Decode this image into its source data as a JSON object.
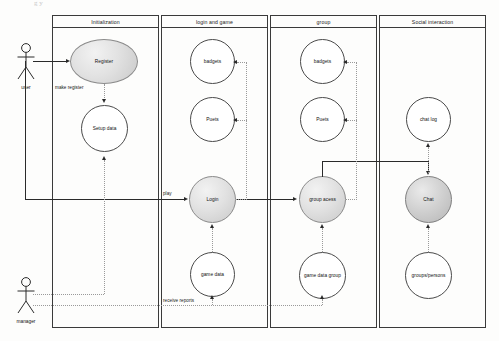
{
  "diagram": {
    "kind": "uml-use-case-diagram",
    "top_partial_caption": "g  y",
    "background": "#fdfdfc",
    "line_color": "#2a2a2a",
    "dotted_color": "#9a9a9a"
  },
  "actors": [
    {
      "id": "user",
      "label": "user"
    },
    {
      "id": "manager",
      "label": "manager"
    }
  ],
  "packages": [
    {
      "id": "initialization",
      "title": "Initialization",
      "use_cases": [
        {
          "id": "register",
          "label": "Register",
          "shape": "ellipse",
          "style": "filled"
        },
        {
          "id": "setup-data",
          "label": "Setup data",
          "shape": "circle",
          "style": "plain"
        }
      ]
    },
    {
      "id": "login-and-game",
      "title": "login and game",
      "use_cases": [
        {
          "id": "badgets-game",
          "label": "badgets",
          "shape": "circle",
          "style": "plain"
        },
        {
          "id": "points-game",
          "label": "Puets",
          "shape": "circle",
          "style": "plain"
        },
        {
          "id": "login",
          "label": "Login",
          "shape": "circle",
          "style": "filled"
        },
        {
          "id": "game-data",
          "label": "game data",
          "shape": "circle",
          "style": "plain"
        }
      ]
    },
    {
      "id": "group",
      "title": "group",
      "use_cases": [
        {
          "id": "badgets-group",
          "label": "badgets",
          "shape": "circle",
          "style": "plain"
        },
        {
          "id": "points-group",
          "label": "Puets",
          "shape": "circle",
          "style": "plain"
        },
        {
          "id": "group-acess",
          "label": "group acess",
          "shape": "circle",
          "style": "filled"
        },
        {
          "id": "game-data-group",
          "label": "game data group",
          "shape": "circle",
          "style": "plain"
        }
      ]
    },
    {
      "id": "social-interaction",
      "title": "Social interaction",
      "use_cases": [
        {
          "id": "chat-log",
          "label": "chat log",
          "shape": "circle",
          "style": "plain"
        },
        {
          "id": "chat",
          "label": "Chat",
          "shape": "circle",
          "style": "filled-dark"
        },
        {
          "id": "groups-persons",
          "label": "groups/persons",
          "shape": "circle",
          "style": "plain"
        }
      ]
    }
  ],
  "edge_labels": {
    "make_register": "make register",
    "play": "play",
    "receive_reports": "receive reports"
  }
}
